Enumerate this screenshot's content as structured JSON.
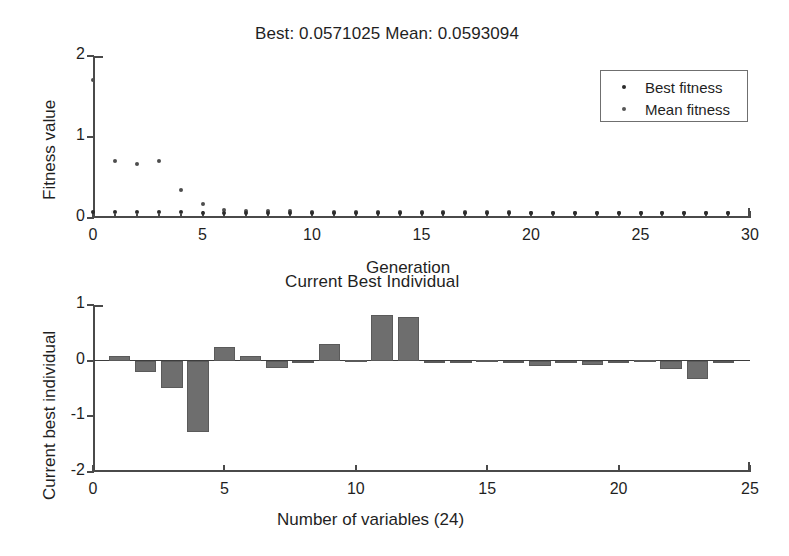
{
  "figure": {
    "background": "#ffffff",
    "axis_color": "#4a4a4a",
    "bar_color": "#6e6e6e",
    "marker_color": "#2b2b2b"
  },
  "top_plot": {
    "title": "Best: 0.0571025 Mean: 0.0593094",
    "xlabel": "Generation",
    "ylabel": "Fitness value",
    "xticks": [
      "0",
      "5",
      "10",
      "15",
      "20",
      "25",
      "30"
    ],
    "yticks": [
      "0",
      "1",
      "2"
    ],
    "legend": [
      {
        "label": "Best fitness",
        "marker": "dot-icon"
      },
      {
        "label": "Mean fitness",
        "marker": "dot-icon"
      }
    ]
  },
  "bottom_plot": {
    "title": "Current Best Individual",
    "xlabel": "Number of variables (24)",
    "ylabel": "Current best individual",
    "xticks": [
      "0",
      "5",
      "10",
      "15",
      "20",
      "25"
    ],
    "yticks": [
      "-2",
      "-1",
      "0",
      "1"
    ]
  },
  "chart_data": [
    {
      "type": "scatter",
      "title": "Best: 0.0571025 Mean: 0.0593094",
      "xlabel": "Generation",
      "ylabel": "Fitness value",
      "xlim": [
        0,
        30
      ],
      "ylim": [
        0,
        2
      ],
      "xticks": [
        0,
        5,
        10,
        15,
        20,
        25,
        30
      ],
      "yticks": [
        0,
        1,
        2
      ],
      "grid": false,
      "legend_position": "upper right",
      "x": [
        0,
        1,
        2,
        3,
        4,
        5,
        6,
        7,
        8,
        9,
        10,
        11,
        12,
        13,
        14,
        15,
        16,
        17,
        18,
        19,
        20,
        21,
        22,
        23,
        24,
        25,
        26,
        27,
        28,
        29
      ],
      "series": [
        {
          "name": "Best fitness",
          "values": [
            0.072,
            0.071,
            0.07,
            0.069,
            0.068,
            0.066,
            0.064,
            0.063,
            0.062,
            0.061,
            0.06,
            0.06,
            0.059,
            0.059,
            0.059,
            0.058,
            0.058,
            0.058,
            0.058,
            0.057,
            0.057,
            0.057,
            0.057,
            0.057,
            0.057,
            0.057,
            0.057,
            0.057,
            0.057,
            0.0571025
          ]
        },
        {
          "name": "Mean fitness",
          "values": [
            1.7,
            0.7,
            0.67,
            0.7,
            0.35,
            0.17,
            0.1,
            0.09,
            0.085,
            0.082,
            0.08,
            0.078,
            0.076,
            0.074,
            0.073,
            0.072,
            0.071,
            0.07,
            0.069,
            0.068,
            0.067,
            0.066,
            0.065,
            0.064,
            0.063,
            0.062,
            0.062,
            0.061,
            0.06,
            0.0593094
          ]
        }
      ]
    },
    {
      "type": "bar",
      "title": "Current Best Individual",
      "xlabel": "Number of variables (24)",
      "ylabel": "Current best individual",
      "xlim": [
        0,
        25
      ],
      "ylim": [
        -2,
        1
      ],
      "xticks": [
        0,
        5,
        10,
        15,
        20,
        25
      ],
      "yticks": [
        -2,
        -1,
        0,
        1
      ],
      "grid": false,
      "categories": [
        1,
        2,
        3,
        4,
        5,
        6,
        7,
        8,
        9,
        10,
        11,
        12,
        13,
        14,
        15,
        16,
        17,
        18,
        19,
        20,
        21,
        22,
        23,
        24
      ],
      "values": [
        0.08,
        -0.2,
        -0.5,
        -1.28,
        0.25,
        0.08,
        -0.13,
        -0.02,
        0.3,
        0.01,
        0.82,
        0.78,
        0.0,
        0.0,
        0.02,
        0.0,
        -0.1,
        -0.05,
        -0.08,
        0.0,
        0.01,
        -0.15,
        -0.33,
        0.0
      ]
    }
  ]
}
